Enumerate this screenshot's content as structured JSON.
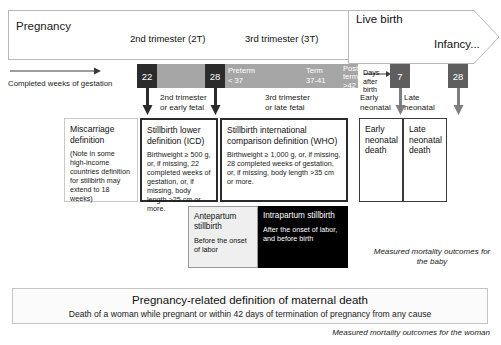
{
  "banner": {
    "pregnancy": "Pregnancy",
    "trimester2": "2nd trimester (2T)",
    "trimester3": "3rd trimester (3T)",
    "live_birth": "Live birth",
    "infancy": "Infancy..."
  },
  "axis": {
    "gestation_caption": "Completed weeks of gestation",
    "days_caption": "Days after birth"
  },
  "timeline": {
    "week22": "22",
    "week28": "28",
    "day7": "7",
    "day28": "28",
    "preterm_title": "Preterm",
    "preterm_range": "< 37",
    "term_title": "Term",
    "term_range": "37-41",
    "postterm_title": "Post term",
    "postterm_range": ">42"
  },
  "sublabels": {
    "second_trimester": "2nd trimester\nor early fetal",
    "third_trimester": "3rd trimester\nor late fetal",
    "early_neonatal": "Early\nneonatal",
    "late_neonatal": "Late\nneonatal"
  },
  "boxes": {
    "miscarriage": {
      "title": "Miscarriage definition",
      "body": "(Note in some high-income countries definition for stillbirth may extend to 18 weeks)"
    },
    "stillbirth_icd": {
      "title": "Stillbirth lower definition (ICD)",
      "body": "Birthweight ≥ 500 g, or, if missing, 22 completed weeks of gestation, or, if missing, body length >25 cm or more."
    },
    "stillbirth_who": {
      "title": "Stillbirth international comparison definition (WHO)",
      "body": "Birthweight ≥ 1,000 g, or, if missing, 28 completed weeks of gestation, or, if missing, body length >35 cm or more."
    },
    "early_neonatal_death": {
      "title": "Early neonatal death"
    },
    "late_neonatal_death": {
      "title": "Late neonatal death"
    },
    "antepartum": {
      "title": "Antepartum stillbirth",
      "body": "Before the onset of labor"
    },
    "intrapartum": {
      "title": "Intrapartum stillbirth",
      "body": "After the onset of labor, and before birth"
    }
  },
  "annotations": {
    "outcome_baby": "Measured mortality outcomes for the  baby",
    "outcome_woman": "Measured mortality outcomes for the woman"
  },
  "maternal": {
    "title": "Pregnancy-related definition of maternal death",
    "subtitle": "Death of a woman while pregnant or within 42 days of termination of pregnancy from any cause"
  },
  "colors": {
    "bar_gray": "#a6a6a6",
    "chip_dark": "#2b2b2b",
    "chip_mid": "#5e5e5e",
    "intrapartum_bg": "#000000",
    "antepartum_bg": "#efefef"
  }
}
